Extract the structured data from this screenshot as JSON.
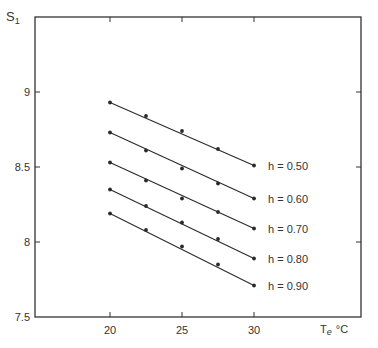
{
  "chart_data": {
    "type": "line",
    "title": "",
    "xlabel": "Te °C",
    "xlabel_main": "T",
    "xlabel_sub": "e",
    "xlabel_unit": "°C",
    "ylabel": "S1",
    "ylabel_main": "S",
    "ylabel_sub": "1",
    "xlim": [
      15,
      37.6
    ],
    "ylim": [
      7.5,
      9.5
    ],
    "x_ticks": [
      20,
      25,
      30
    ],
    "x_tick_labels": [
      "20",
      "25",
      "30"
    ],
    "y_ticks": [
      7.5,
      8,
      8.5,
      9
    ],
    "y_tick_labels": [
      "7.5",
      "8",
      "8.5",
      "9"
    ],
    "grid": false,
    "legend": "inline labels at right end of each line",
    "x": [
      20,
      22.5,
      25,
      27.5,
      30
    ],
    "series": [
      {
        "name": "h = 0.50",
        "values": [
          8.93,
          8.84,
          8.74,
          8.62,
          8.51
        ]
      },
      {
        "name": "h = 0.60",
        "values": [
          8.73,
          8.61,
          8.49,
          8.39,
          8.29
        ]
      },
      {
        "name": "h = 0.70",
        "values": [
          8.53,
          8.41,
          8.29,
          8.2,
          8.09
        ]
      },
      {
        "name": "h = 0.80",
        "values": [
          8.35,
          8.24,
          8.13,
          8.02,
          7.89
        ]
      },
      {
        "name": "h = 0.90",
        "values": [
          8.19,
          8.08,
          7.97,
          7.85,
          7.71
        ]
      }
    ]
  },
  "colors": {
    "line": "#2a2a2a",
    "frame": "#333333",
    "background": "#ffffff"
  }
}
